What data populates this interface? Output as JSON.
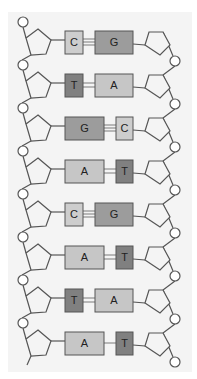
{
  "diagram": {
    "title": "",
    "colors": {
      "background": "#ffffff",
      "panel": "#f4f4f4",
      "stroke": "#555555",
      "A": "#c6c6c6",
      "T": "#808080",
      "G": "#9c9c9c",
      "C": "#cdcdcd"
    },
    "base_pairs": [
      {
        "left": "C",
        "right": "G",
        "bonds": 3
      },
      {
        "left": "T",
        "right": "A",
        "bonds": 2
      },
      {
        "left": "G",
        "right": "C",
        "bonds": 3
      },
      {
        "left": "A",
        "right": "T",
        "bonds": 2
      },
      {
        "left": "C",
        "right": "G",
        "bonds": 3
      },
      {
        "left": "A",
        "right": "T",
        "bonds": 2
      },
      {
        "left": "T",
        "right": "A",
        "bonds": 2
      },
      {
        "left": "A",
        "right": "T",
        "bonds": 1
      }
    ],
    "components": {
      "left_strand": "sugar-phosphate backbone (pentagon sugars, circle phosphates)",
      "right_strand": "sugar-phosphate backbone (pentagon sugars, circle phosphates)"
    }
  }
}
